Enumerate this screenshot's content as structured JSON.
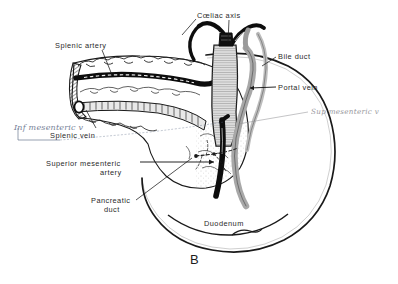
{
  "figure": {
    "letter": "B",
    "background_color": "#ffffff",
    "ink_color": "#1a1a1a",
    "label_color": "#2a2a2a",
    "handwriting_blue": "#5d6b86",
    "handwriting_grey": "#8d8d92",
    "width": 398,
    "height": 284
  },
  "labels": [
    {
      "id": "coeliac-axis",
      "text": "Cœliac axis",
      "x": 197,
      "y": 11,
      "align": "left"
    },
    {
      "id": "splenic-artery",
      "text": "Splenic artery",
      "x": 55,
      "y": 41,
      "align": "left"
    },
    {
      "id": "bile-duct",
      "text": "Bile duct",
      "x": 278,
      "y": 52,
      "align": "left"
    },
    {
      "id": "portal-vein",
      "text": "Portal vein",
      "x": 278,
      "y": 83,
      "align": "left"
    },
    {
      "id": "splenic-vein",
      "text": "Splenic vein",
      "x": 50,
      "y": 131,
      "align": "left"
    },
    {
      "id": "superior-mesenteric-artery-line1",
      "text": "Superior mesenteric",
      "x": 46,
      "y": 159,
      "align": "left"
    },
    {
      "id": "superior-mesenteric-artery-line2",
      "text": "artery",
      "x": 100,
      "y": 168,
      "align": "left"
    },
    {
      "id": "pancreatic-duct-line1",
      "text": "Pancreatic",
      "x": 91,
      "y": 196,
      "align": "left"
    },
    {
      "id": "pancreatic-duct-line2",
      "text": "duct",
      "x": 104,
      "y": 205,
      "align": "left"
    },
    {
      "id": "duodenum",
      "text": "Duodenum",
      "x": 204,
      "y": 219,
      "align": "left"
    }
  ],
  "handwritten_annotations": [
    {
      "id": "inf-mesenteric-vein",
      "text": "Inf mesenteric v",
      "x": 14,
      "y": 124,
      "style": "blue"
    },
    {
      "id": "sup-mesenteric-vein",
      "text": "Sup mesenteric v",
      "x": 311,
      "y": 108,
      "style": "grey"
    }
  ],
  "figure_letter_position": {
    "x": 190,
    "y": 252
  }
}
